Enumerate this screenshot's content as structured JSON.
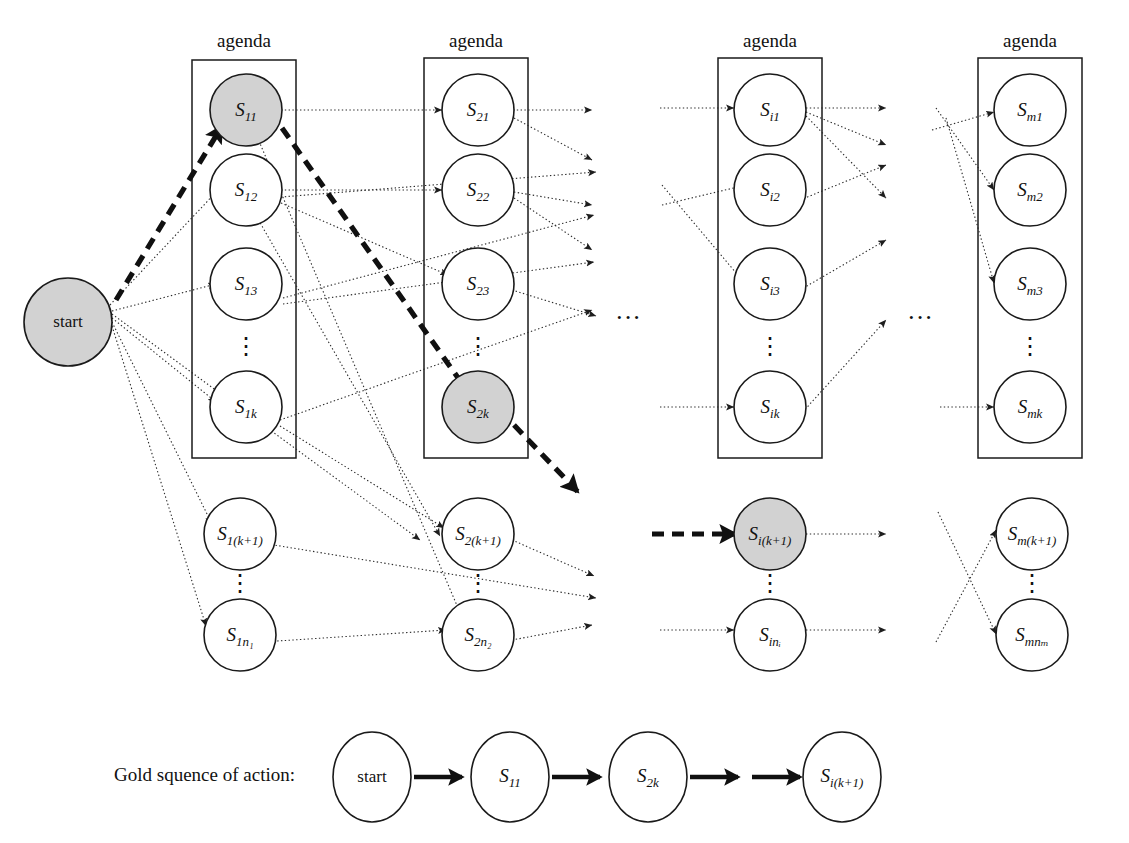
{
  "figure": {
    "columns": [
      {
        "id": "col1",
        "agenda_label": "agenda",
        "box_nodes": [
          {
            "id": "s11",
            "label": "S",
            "sub": "11",
            "filled": true
          },
          {
            "id": "s12",
            "label": "S",
            "sub": "12",
            "filled": false
          },
          {
            "id": "s13",
            "label": "S",
            "sub": "13",
            "filled": false
          },
          {
            "id": "s1k",
            "label": "S",
            "sub": "1k",
            "filled": false
          }
        ],
        "box_vdots": "⋮",
        "outside_nodes": [
          {
            "id": "s1k1",
            "label": "S",
            "sub": "1(k+1)",
            "filled": false
          },
          {
            "id": "s1n1",
            "label": "S",
            "sub": "1n₁",
            "filled": false
          }
        ],
        "outside_vdots": "⋮"
      },
      {
        "id": "col2",
        "agenda_label": "agenda",
        "box_nodes": [
          {
            "id": "s21",
            "label": "S",
            "sub": "21",
            "filled": false
          },
          {
            "id": "s22",
            "label": "S",
            "sub": "22",
            "filled": false
          },
          {
            "id": "s23",
            "label": "S",
            "sub": "23",
            "filled": false
          },
          {
            "id": "s2k",
            "label": "S",
            "sub": "2k",
            "filled": true
          }
        ],
        "box_vdots": "⋮",
        "outside_nodes": [
          {
            "id": "s2k1",
            "label": "S",
            "sub": "2(k+1)",
            "filled": false
          },
          {
            "id": "s2n2",
            "label": "S",
            "sub": "2n₂",
            "filled": false
          }
        ],
        "outside_vdots": "⋮"
      },
      {
        "id": "col3",
        "agenda_label": "agenda",
        "box_nodes": [
          {
            "id": "si1",
            "label": "S",
            "sub": "i1",
            "filled": false
          },
          {
            "id": "si2",
            "label": "S",
            "sub": "i2",
            "filled": false
          },
          {
            "id": "si3",
            "label": "S",
            "sub": "i3",
            "filled": false
          },
          {
            "id": "sik",
            "label": "S",
            "sub": "ik",
            "filled": false
          }
        ],
        "box_vdots": "⋮",
        "outside_nodes": [
          {
            "id": "sik1",
            "label": "S",
            "sub": "i(k+1)",
            "filled": true
          },
          {
            "id": "sini",
            "label": "S",
            "sub": "inᵢ",
            "filled": false
          }
        ],
        "outside_vdots": "⋮"
      },
      {
        "id": "col4",
        "agenda_label": "agenda",
        "box_nodes": [
          {
            "id": "sm1",
            "label": "S",
            "sub": "m1",
            "filled": false
          },
          {
            "id": "sm2",
            "label": "S",
            "sub": "m2",
            "filled": false
          },
          {
            "id": "sm3",
            "label": "S",
            "sub": "m3",
            "filled": false
          },
          {
            "id": "smk",
            "label": "S",
            "sub": "mk",
            "filled": false
          }
        ],
        "box_vdots": "⋮",
        "outside_nodes": [
          {
            "id": "smk1",
            "label": "S",
            "sub": "m(k+1)",
            "filled": false
          },
          {
            "id": "smnm",
            "label": "S",
            "sub": "mnₘ",
            "filled": false
          }
        ],
        "outside_vdots": "⋮"
      }
    ],
    "start_node": {
      "id": "start",
      "label": "start",
      "filled": true
    },
    "ellipses_between_columns": [
      "···",
      "···"
    ],
    "gold_sequence": {
      "caption": "Gold squence of action:",
      "nodes": [
        {
          "id": "g-start",
          "label": "start",
          "sub": ""
        },
        {
          "id": "g-s11",
          "label": "S",
          "sub": "11"
        },
        {
          "id": "g-s2k",
          "label": "S",
          "sub": "2k"
        },
        {
          "id": "g-sik1",
          "label": "S",
          "sub": "i(k+1)"
        }
      ]
    },
    "colors": {
      "node_fill": "#ffffff",
      "node_fill_highlight": "#d2d2d2",
      "stroke": "#1a1a1a",
      "edge": "#2b2b2b",
      "gold_path": "#101010",
      "background": "#ffffff"
    }
  }
}
